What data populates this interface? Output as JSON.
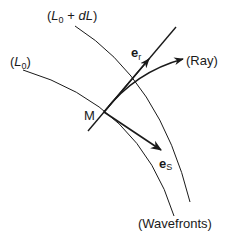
{
  "diagram": {
    "labels": {
      "wavefront_outer": {
        "open": "(",
        "L": "L",
        "sub": "0",
        "mid": " + ",
        "dL": "dL",
        "close": ")"
      },
      "wavefront_inner": {
        "open": "(",
        "L": "L",
        "sub": "0",
        "close": ")"
      },
      "point": "M",
      "e_r": {
        "base": "e",
        "sub": "r"
      },
      "e_s": {
        "base": "e",
        "sub": "S"
      },
      "ray": "(Ray)",
      "wavefronts": "(Wavefronts)"
    },
    "colors": {
      "line": "#1a1a1a",
      "background": "#ffffff"
    }
  }
}
